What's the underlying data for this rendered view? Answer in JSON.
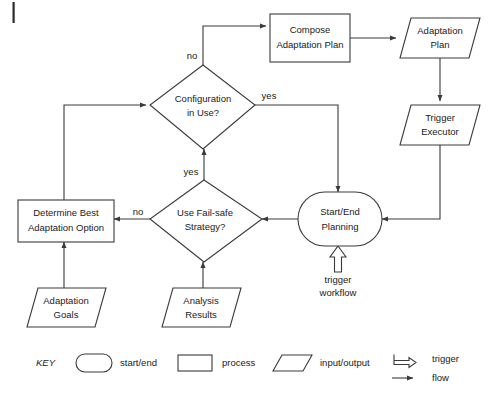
{
  "diagram": {
    "nodes": {
      "compose_adaptation_plan": {
        "line1": "Compose",
        "line2": "Adaptation Plan",
        "type": "process"
      },
      "adaptation_plan": {
        "line1": "Adaptation",
        "line2": "Plan",
        "type": "input/output"
      },
      "trigger_executor": {
        "line1": "Trigger",
        "line2": "Executor",
        "type": "input/output"
      },
      "configuration_in_use": {
        "line1": "Configuration",
        "line2": "in Use?",
        "type": "decision"
      },
      "use_failsafe_strategy": {
        "line1": "Use Fail-safe",
        "line2": "Strategy?",
        "type": "decision"
      },
      "determine_best_adaptation_option": {
        "line1": "Determine Best",
        "line2": "Adaptation Option",
        "type": "process"
      },
      "start_end_planning": {
        "line1": "Start/End",
        "line2": "Planning",
        "type": "start/end"
      },
      "adaptation_goals": {
        "line1": "Adaptation",
        "line2": "Goals",
        "type": "input/output"
      },
      "analysis_results": {
        "line1": "Analysis",
        "line2": "Results",
        "type": "input/output"
      }
    },
    "edge_labels": {
      "config_no": "no",
      "config_yes": "yes",
      "failsafe_yes": "yes",
      "failsafe_no": "no"
    },
    "trigger_annotation": {
      "line1": "trigger",
      "line2": "workflow"
    }
  },
  "key": {
    "title": "KEY",
    "items": [
      {
        "label": "start/end",
        "icon": "rounded-rect-icon"
      },
      {
        "label": "process",
        "icon": "rectangle-icon"
      },
      {
        "label": "input/output",
        "icon": "parallelogram-icon"
      },
      {
        "label": "trigger",
        "icon": "block-arrow-icon"
      },
      {
        "label": "flow",
        "icon": "line-arrow-icon"
      }
    ]
  },
  "colors": {
    "stroke": "#3a3a3a",
    "text": "#1a1a1a",
    "background": "#ffffff"
  }
}
